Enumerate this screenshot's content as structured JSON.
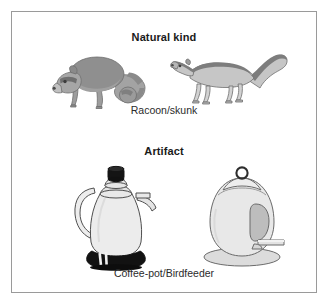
{
  "figure": {
    "border_color": "#9a9a9a",
    "background": "#ffffff",
    "sections": [
      {
        "heading": "Natural kind",
        "caption": "Racoon/skunk",
        "items": [
          {
            "name": "raccoon",
            "label": "raccoon-illustration"
          },
          {
            "name": "skunk",
            "label": "skunk-illustration"
          }
        ]
      },
      {
        "heading": "Artifact",
        "caption": "Coffee-pot/Birdfeeder",
        "items": [
          {
            "name": "coffee-pot",
            "label": "coffee-pot-illustration"
          },
          {
            "name": "birdfeeder",
            "label": "birdfeeder-illustration"
          }
        ]
      }
    ]
  },
  "headings": {
    "natural_kind": "Natural kind",
    "artifact": "Artifact"
  },
  "captions": {
    "racoon_skunk": "Racoon/skunk",
    "coffee_pot_birdfeeder": "Coffee-pot/Birdfeeder"
  },
  "colors": {
    "frame_stroke": "#9a9a9a",
    "heading_text": "#1a1a1a",
    "caption_text": "#2b2b2b",
    "animal_body_dark": "#8f8f8f",
    "animal_body_mid": "#a8a8a8",
    "animal_body_light": "#c9c9c9",
    "object_fill": "#e6e6e6",
    "object_shade": "#cfcfcf",
    "object_dark": "#1a1a1a",
    "outline": "#555555"
  }
}
